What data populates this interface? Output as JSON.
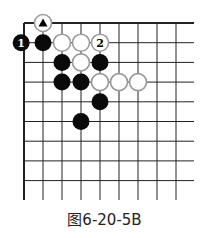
{
  "caption": "图6-20-5B",
  "board": {
    "origin": {
      "x": 24,
      "y": 23
    },
    "spacing_x": 19,
    "spacing_y": 19.7,
    "cols": 9,
    "rows": 9,
    "line_right_x": 194,
    "line_bottom_y": 200,
    "stone_radius": 8.5,
    "line_color": "#222222",
    "black_color": "#0a0a0a",
    "white_fill": "#ffffff",
    "white_stroke": "#9a9a9a"
  },
  "stones": [
    {
      "color": "white",
      "col": 1,
      "row": 0,
      "mark": "triangle",
      "label": ""
    },
    {
      "color": "black",
      "col": -0.15,
      "row": 1,
      "mark": "",
      "label": "1"
    },
    {
      "color": "black",
      "col": 1,
      "row": 1,
      "mark": "",
      "label": ""
    },
    {
      "color": "white",
      "col": 2,
      "row": 1,
      "mark": "",
      "label": ""
    },
    {
      "color": "white",
      "col": 3,
      "row": 1,
      "mark": "",
      "label": ""
    },
    {
      "color": "white",
      "col": 4,
      "row": 1,
      "mark": "",
      "label": "2"
    },
    {
      "color": "black",
      "col": 2,
      "row": 2,
      "mark": "",
      "label": ""
    },
    {
      "color": "white",
      "col": 3,
      "row": 2,
      "mark": "",
      "label": ""
    },
    {
      "color": "black",
      "col": 4,
      "row": 2,
      "mark": "",
      "label": ""
    },
    {
      "color": "black",
      "col": 2,
      "row": 3,
      "mark": "",
      "label": ""
    },
    {
      "color": "black",
      "col": 3,
      "row": 3,
      "mark": "",
      "label": ""
    },
    {
      "color": "white",
      "col": 4,
      "row": 3,
      "mark": "",
      "label": ""
    },
    {
      "color": "white",
      "col": 5,
      "row": 3,
      "mark": "",
      "label": ""
    },
    {
      "color": "white",
      "col": 6,
      "row": 3,
      "mark": "",
      "label": ""
    },
    {
      "color": "black",
      "col": 4,
      "row": 4,
      "mark": "",
      "label": ""
    },
    {
      "color": "black",
      "col": 3,
      "row": 5,
      "mark": "",
      "label": ""
    }
  ]
}
